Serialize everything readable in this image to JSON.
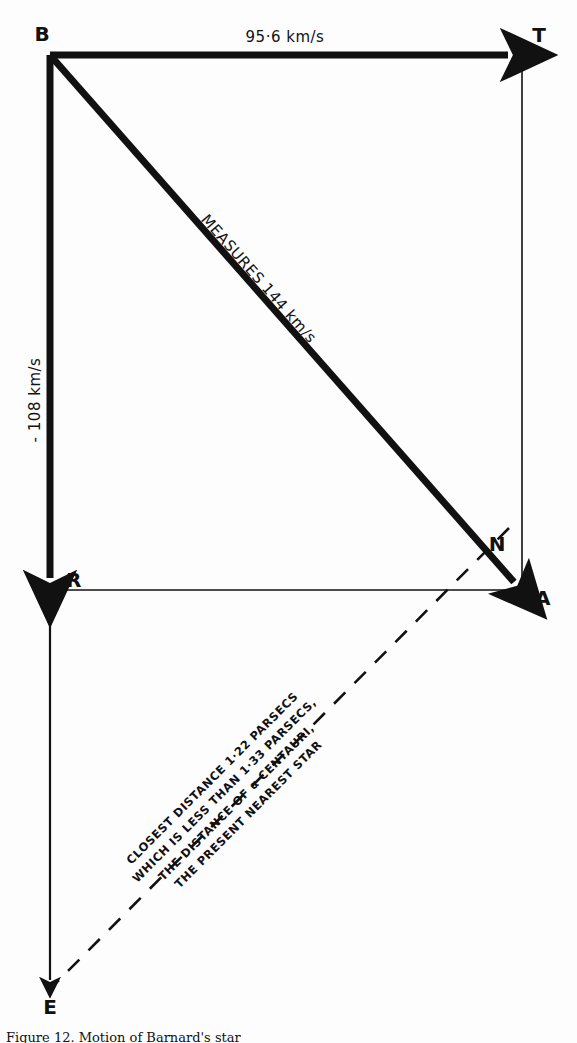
{
  "figure": {
    "title_caption": "Figure 12. Motion of Barnard's star",
    "ink_color": "#111111",
    "background_color": "#ffffff",
    "vertices": [
      {
        "id": "B",
        "label": "B",
        "x": 50,
        "y": 55
      },
      {
        "id": "T",
        "label": "T",
        "x": 522,
        "y": 55
      },
      {
        "id": "R",
        "label": "R",
        "x": 50,
        "y": 590
      },
      {
        "id": "A",
        "label": "A",
        "x": 522,
        "y": 590
      },
      {
        "id": "N",
        "label": "N",
        "x": 497,
        "y": 545
      },
      {
        "id": "E",
        "label": "E",
        "x": 50,
        "y": 988
      }
    ],
    "vectors": [
      {
        "name": "tangential-velocity",
        "from": "B",
        "to": "T",
        "label": "95·6 km/s",
        "style": "thick-arrow",
        "orientation": "horizontal"
      },
      {
        "name": "radial-velocity",
        "from": "B",
        "to": "R",
        "label": "- 108 km/s",
        "style": "thick-arrow",
        "orientation": "vertical"
      },
      {
        "name": "space-velocity",
        "from": "B",
        "to": "A",
        "label": "MEASURES 144 km/s",
        "style": "thick-arrow",
        "orientation": "diagonal"
      }
    ],
    "construction_lines": [
      {
        "name": "top-right-side",
        "from": "T",
        "to": "A",
        "style": "thin-solid"
      },
      {
        "name": "bottom-side",
        "from": "R",
        "to": "A",
        "style": "thin-solid"
      },
      {
        "name": "left-extension",
        "from": "R",
        "to": "E",
        "style": "thin-solid-arrow"
      }
    ],
    "dashed_line": {
      "name": "closest-approach-line",
      "from": "N",
      "through": "A",
      "to": "E",
      "style": "dashed"
    },
    "annotation": {
      "name": "closest-distance-note",
      "lines": [
        "CLOSEST DISTANCE 1·22 PARSECS",
        "WHICH IS LESS THAN 1·33 PARSECS,",
        "THE DISTANCE OF α CENTAURI,",
        "THE PRESENT NEAREST STAR"
      ]
    }
  }
}
